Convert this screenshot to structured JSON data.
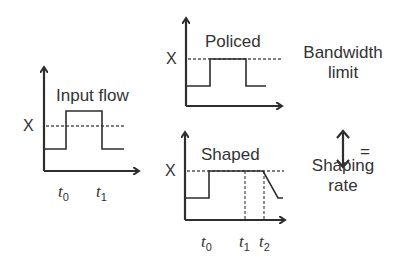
{
  "input_panel": {
    "title": "Input flow",
    "level_label": "X",
    "time_labels": [
      {
        "t": "t",
        "sub": "0"
      },
      {
        "t": "t",
        "sub": "1"
      }
    ]
  },
  "policed_panel": {
    "title": "Policed",
    "level_label": "X"
  },
  "shaped_panel": {
    "title": "Shaped",
    "level_label": "X",
    "time_labels": [
      {
        "t": "t",
        "sub": "0"
      },
      {
        "t": "t",
        "sub": "1"
      },
      {
        "t": "t",
        "sub": "2"
      }
    ]
  },
  "legend": {
    "top_line1": "Bandwidth",
    "top_line2": "limit",
    "equals": "=",
    "bottom_line1": "Shaping",
    "bottom_line2": "rate"
  },
  "colors": {
    "line": "#2e2e2e",
    "dashed": "#555555",
    "text": "#333333"
  }
}
